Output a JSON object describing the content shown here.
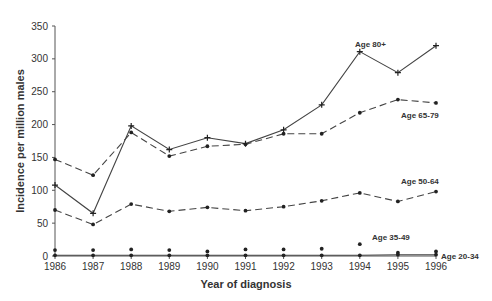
{
  "chart_data": {
    "type": "line",
    "title": "",
    "xlabel": "Year of diagnosis",
    "ylabel": "Incidence per million males",
    "ylim": [
      0,
      350
    ],
    "yticks": [
      0,
      50,
      100,
      150,
      200,
      250,
      300,
      350
    ],
    "x": [
      1986,
      1987,
      1988,
      1989,
      1990,
      1991,
      1992,
      1993,
      1994,
      1995,
      1996
    ],
    "grid": false,
    "legend": "inline labels at line ends",
    "series": [
      {
        "name": "Age 80+",
        "style": "solid",
        "marker": "plus",
        "values": [
          108,
          65,
          198,
          162,
          180,
          171,
          192,
          230,
          311,
          279,
          320
        ],
        "label_pos": [
          355,
          47
        ]
      },
      {
        "name": "Age 65-79",
        "style": "dashed",
        "marker": "dot",
        "values": [
          147,
          123,
          188,
          152,
          167,
          170,
          186,
          186,
          218,
          238,
          233
        ],
        "label_pos": [
          401,
          118
        ]
      },
      {
        "name": "Age 50-64",
        "style": "dashed",
        "marker": "dot",
        "values": [
          70,
          48,
          79,
          68,
          74,
          69,
          75,
          84,
          96,
          83,
          98
        ],
        "label_pos": [
          401,
          184
        ]
      },
      {
        "name": "Age 35-49",
        "style": "none",
        "marker": "dot",
        "values": [
          9,
          9,
          10,
          9,
          7,
          10,
          10,
          11,
          18,
          5,
          7
        ],
        "label_pos": [
          372,
          240
        ]
      },
      {
        "name": "Age 20-34",
        "style": "solid",
        "marker": "dot",
        "values": [
          1,
          1,
          1,
          1,
          1,
          1,
          1,
          1,
          1,
          2,
          2
        ],
        "label_pos": [
          441,
          259
        ]
      }
    ]
  },
  "colors": {
    "line": "#444444",
    "axis": "#555555",
    "text": "#333333"
  }
}
